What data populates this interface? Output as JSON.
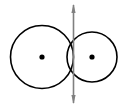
{
  "figure": {
    "canvas": {
      "width": 128,
      "height": 109,
      "background": "#ffffff"
    },
    "colors": {
      "stroke": "#000000",
      "center_dot": "#000000",
      "arrow": "#808080",
      "background": "#ffffff"
    },
    "shapes": {
      "left_circle": {
        "label": "left circle",
        "cx": 42,
        "cy": 57,
        "r": 31.5,
        "stroke_width": 1.6,
        "fill": "none"
      },
      "right_circle": {
        "label": "right circle",
        "cx": 92,
        "cy": 57,
        "r": 25,
        "stroke_width": 1.6,
        "fill": "none"
      },
      "left_center_dot": {
        "label": "left circle center",
        "cx": 42,
        "cy": 57,
        "r": 2.6
      },
      "right_center_dot": {
        "label": "right circle center",
        "cx": 92,
        "cy": 57,
        "r": 2.6
      },
      "tangent_arrow": {
        "label": "vertical double-headed tangent arrow",
        "x": 73.5,
        "y_top": 4,
        "y_bottom": 104,
        "stroke_width": 1.6,
        "head_width": 4.2,
        "head_length": 9
      }
    },
    "annotations": {
      "tangent_point_x": 73.5,
      "tangent_point_y": 57
    }
  }
}
